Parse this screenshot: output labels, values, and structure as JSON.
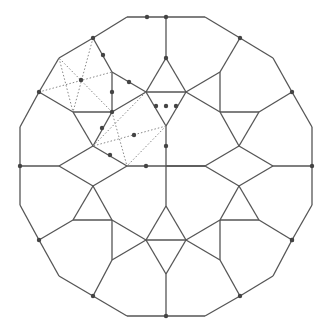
{
  "diagram": {
    "title": "",
    "colors": {
      "line": "#555555",
      "dotted": "#888888",
      "dot": "#444444",
      "background": "#ffffff"
    },
    "center": [
      166,
      166
    ]
  }
}
